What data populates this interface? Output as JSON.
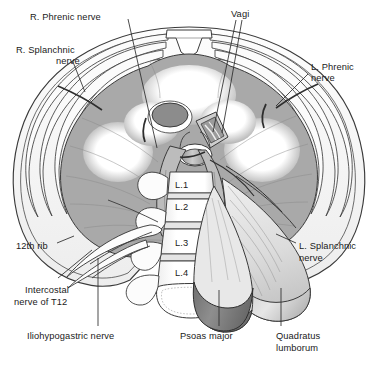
{
  "figure": {
    "background_color": "#ffffff",
    "ink_color": "#1a1a1a"
  },
  "palette": {
    "diaphragm_muscle": "#a9a9a9",
    "central_tendon": "#ffffff",
    "body_wall": "#f2f2f2",
    "rib_fill": "#fbfbfb",
    "vertebra_fill": "#fdfdfd",
    "psoas_shadow": "#8e8e8e",
    "quadratus_fill": "#d9d9d9",
    "esophagus_fill": "#8c8c8c",
    "aorta_fill": "#b5b5b5",
    "leader_line": "#2b2b2b",
    "outline": "#3a3a3a"
  },
  "labels": [
    {
      "id": "r-phrenic-nerve",
      "text": "R. Phrenic nerve",
      "x": 30,
      "y": 12,
      "align": "left"
    },
    {
      "id": "vagi",
      "text": "Vagi",
      "x": 231,
      "y": 9,
      "align": "left"
    },
    {
      "id": "r-splanchnic-nerve",
      "text": "R. Splanchnic",
      "x": 16,
      "y": 45,
      "align": "left"
    },
    {
      "id": "r-splanchnic-nerve2",
      "text": "nerve",
      "x": 56,
      "y": 56,
      "align": "left"
    },
    {
      "id": "l-phrenic-nerve",
      "text": "L. Phrenic",
      "x": 311,
      "y": 62,
      "align": "left"
    },
    {
      "id": "l-phrenic-nerve2",
      "text": "nerve",
      "x": 311,
      "y": 73,
      "align": "left"
    },
    {
      "id": "twelfth-rib",
      "text": "12th rib",
      "x": 16,
      "y": 241,
      "align": "left"
    },
    {
      "id": "l-splanchnic-nerve",
      "text": "L. Splanchnic",
      "x": 299,
      "y": 241,
      "align": "left"
    },
    {
      "id": "l-splanchnic-nerve2",
      "text": "nerve",
      "x": 299,
      "y": 253,
      "align": "left"
    },
    {
      "id": "intercostal-nerve",
      "text": "Intercostal",
      "x": 25,
      "y": 285,
      "align": "left"
    },
    {
      "id": "intercostal-nerve2",
      "text": "nerve of T12",
      "x": 14,
      "y": 297,
      "align": "left"
    },
    {
      "id": "iliohypogastric",
      "text": "Iliohypogastric nerve",
      "x": 27,
      "y": 331,
      "align": "left"
    },
    {
      "id": "psoas-major",
      "text": "Psoas major",
      "x": 180,
      "y": 331,
      "align": "left"
    },
    {
      "id": "quadratus-lumborum",
      "text": "Quadratus",
      "x": 276,
      "y": 331,
      "align": "left"
    },
    {
      "id": "quadratus-lumborum2",
      "text": "lumborum",
      "x": 276,
      "y": 343,
      "align": "left"
    }
  ],
  "vertebrae": [
    {
      "id": "l1",
      "text": "L.1",
      "x": 175,
      "y": 180
    },
    {
      "id": "l2",
      "text": "L.2",
      "x": 175,
      "y": 202
    },
    {
      "id": "l3",
      "text": "L.3",
      "x": 175,
      "y": 238
    },
    {
      "id": "l4",
      "text": "L.4",
      "x": 175,
      "y": 268
    }
  ],
  "caption": {
    "text": "                                                                                                       "
  },
  "structures": [
    "body-wall-outline",
    "rib-cage",
    "diaphragm-muscle",
    "central-tendon",
    "esophageal-hiatus",
    "aortic-hiatus",
    "caval-opening",
    "vertebral-column",
    "psoas-major-muscle",
    "quadratus-lumborum-muscle",
    "crus-of-diaphragm",
    "twelfth-rib-bone",
    "transverse-processes"
  ]
}
